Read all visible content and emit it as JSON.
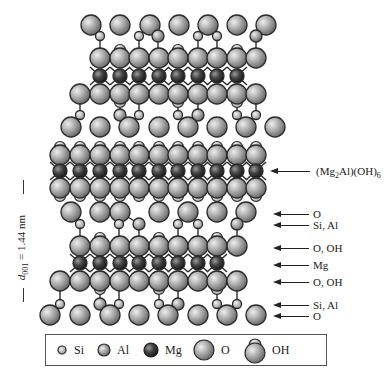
{
  "figure": {
    "type": "crystal-structure"
  },
  "colors": {
    "atom_fill": "#9a9a9a",
    "atom_highlight": "#e6e6e6",
    "mg_fill": "#3a3a3a",
    "outline": "#2a2a2a",
    "bond": "#2a2a2a"
  },
  "labels": {
    "brucite_layer": {
      "pre": "(Mg",
      "sub1": "2",
      "mid": "Al)(OH)",
      "sub2": "6"
    },
    "o_top": "O",
    "si_al_top": "Si, Al",
    "o_oh_top": "O, OH",
    "mg": "Mg",
    "o_oh_bottom": "O, OH",
    "si_al_bottom": "Si, Al",
    "o_bottom": "O"
  },
  "d_spacing": {
    "symbol": "d",
    "sub": "001",
    "value": " = 1.44 nm"
  },
  "legend": [
    {
      "key": "si",
      "label": "Si"
    },
    {
      "key": "al",
      "label": "Al"
    },
    {
      "key": "mg",
      "label": "Mg"
    },
    {
      "key": "o",
      "label": "O"
    },
    {
      "key": "oh",
      "label": "OH"
    }
  ],
  "structure": {
    "upper_tot": {
      "o_top_y": 25,
      "o_top_x": [
        91,
        120,
        150,
        179,
        208,
        237,
        266
      ],
      "si_y": 36,
      "si_x": [
        100,
        139,
        158,
        198,
        217,
        256
      ],
      "oh1_y": 58,
      "oh1_x": [
        100,
        120,
        139,
        159,
        178,
        198,
        217,
        237,
        256
      ],
      "mg_y": 76,
      "mg_x": [
        100,
        120,
        139,
        159,
        178,
        198,
        217,
        237
      ],
      "oh2_y": 94,
      "oh2_x": [
        80,
        100,
        120,
        139,
        159,
        178,
        198,
        217,
        237,
        256
      ],
      "si2_y": 115,
      "si2_x": [
        80,
        120,
        139,
        178,
        198,
        237,
        256
      ],
      "o_bot_y": 127,
      "o_bot_x": [
        71,
        100,
        129,
        159,
        188,
        217,
        246,
        275
      ]
    },
    "brucite": {
      "oh_top_y": 155,
      "mg_y": 171,
      "oh_bot_y": 188,
      "x": [
        60,
        80,
        100,
        120,
        139,
        159,
        178,
        198,
        217,
        237,
        256
      ]
    },
    "lower_tot": {
      "o_top_y": 212,
      "o_top_x": [
        71,
        100,
        120,
        159,
        188,
        217,
        246
      ],
      "si_y": 224,
      "si_x": [
        80,
        119,
        139,
        178,
        198,
        237
      ],
      "oh1_y": 246,
      "oh1_x": [
        80,
        100,
        120,
        139,
        159,
        178,
        198,
        217,
        237
      ],
      "mg_y": 263,
      "mg_x": [
        80,
        100,
        120,
        139,
        159,
        178,
        198,
        217
      ],
      "oh2_y": 281,
      "oh2_x": [
        60,
        80,
        100,
        120,
        139,
        159,
        178,
        198,
        217,
        237
      ],
      "si2_y": 304,
      "si2_x": [
        60,
        100,
        119,
        159,
        178,
        217,
        237
      ],
      "o_bot_y": 315,
      "o_bot_x": [
        50,
        80,
        110,
        139,
        168,
        198,
        227,
        256
      ]
    }
  }
}
